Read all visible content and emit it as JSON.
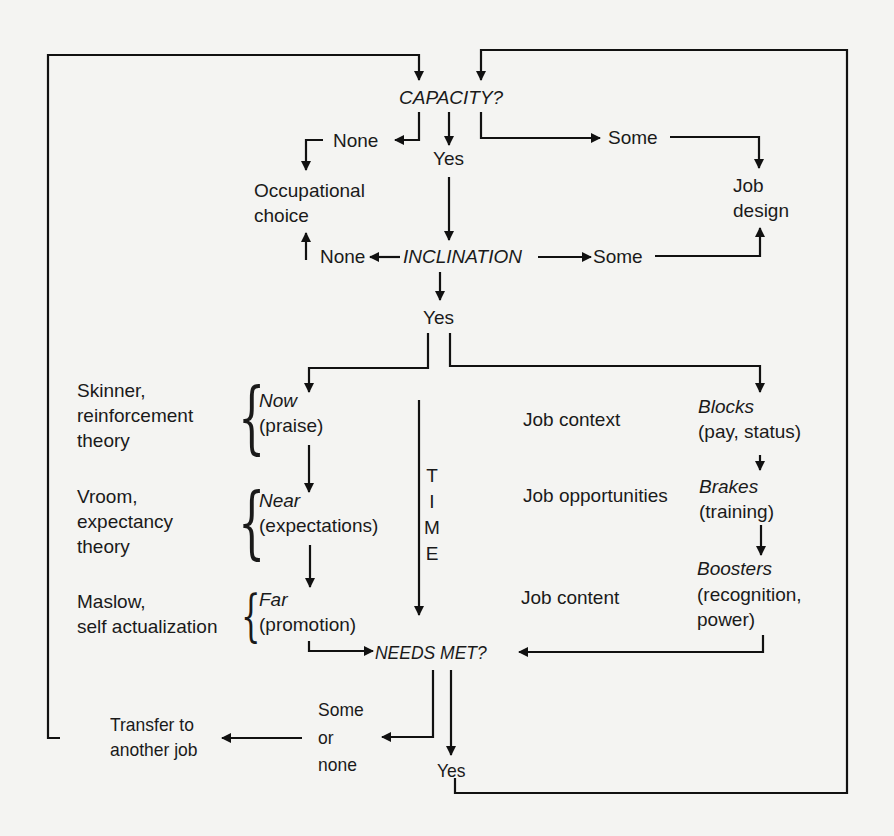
{
  "diagram": {
    "decisions": {
      "capacity": "CAPACITY?",
      "inclination": "INCLINATION",
      "needs_met": "NEEDS MET?"
    },
    "capacity_branches": {
      "none": "None",
      "yes": "Yes",
      "some": "Some"
    },
    "inclination_branches": {
      "none": "None",
      "yes": "Yes",
      "some": "Some"
    },
    "outcomes": {
      "occupational_choice": [
        "Occupational",
        "choice"
      ],
      "job_design": [
        "Job",
        "design"
      ],
      "transfer": [
        "Transfer to",
        "another job"
      ]
    },
    "theories": [
      {
        "lines": [
          "Skinner,",
          "reinforcement",
          "theory"
        ],
        "reward_title": "Now",
        "reward_detail": "(praise)"
      },
      {
        "lines": [
          "Vroom,",
          "expectancy",
          "theory"
        ],
        "reward_title": "Near",
        "reward_detail": "(expectations)"
      },
      {
        "lines": [
          "Maslow,",
          "self actualization"
        ],
        "reward_title": "Far",
        "reward_detail": "(promotion)"
      }
    ],
    "time_label": [
      "T",
      "I",
      "M",
      "E"
    ],
    "job_factors": [
      {
        "label": "Job context",
        "title": "Blocks",
        "detail": [
          "(pay, status)"
        ]
      },
      {
        "label": "Job opportunities",
        "title": "Brakes",
        "detail": [
          "(training)"
        ]
      },
      {
        "label": "Job content",
        "title": "Boosters",
        "detail": [
          "(recognition,",
          "power)"
        ]
      }
    ],
    "needs_met_branches": {
      "some_or_none": [
        "Some",
        "or",
        "none"
      ],
      "yes": "Yes"
    }
  }
}
